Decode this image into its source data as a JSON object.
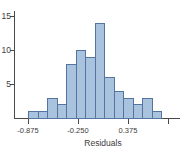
{
  "chart_data": {
    "type": "bar",
    "subtype": "histogram",
    "title": "",
    "xlabel": "Residuals",
    "ylabel": "",
    "bin_start": -0.875,
    "bin_width": 0.125,
    "bin_edges": [
      -0.875,
      -0.75,
      -0.625,
      -0.5,
      -0.375,
      -0.25,
      -0.125,
      0,
      0.125,
      0.25,
      0.375,
      0.5,
      0.625,
      0.75,
      0.875
    ],
    "counts": [
      1,
      1,
      3,
      2,
      8,
      10,
      9,
      14,
      6,
      4,
      3,
      2,
      3,
      1
    ],
    "y_ticks": [
      5,
      10,
      15
    ],
    "x_ticks": [
      {
        "value": -0.875,
        "label": "-0.875"
      },
      {
        "value": -0.25,
        "label": "-0.250"
      },
      {
        "value": 0.375,
        "label": "0.375"
      },
      {
        "value": 0.875,
        "label": ""
      }
    ],
    "ylim": [
      0,
      15.7
    ],
    "grid": false,
    "legend_position": "none",
    "colors": {
      "bar_fill": "#a9c2dd",
      "bar_stroke": "#54759f",
      "axis": "#4a4a4a",
      "text": "#3c3c3c"
    }
  },
  "layout_px": {
    "x_origin": 28,
    "y_base": 118,
    "px_per_count": 6.8,
    "px_per_bin": 9.5,
    "px_per_unit": 80
  }
}
